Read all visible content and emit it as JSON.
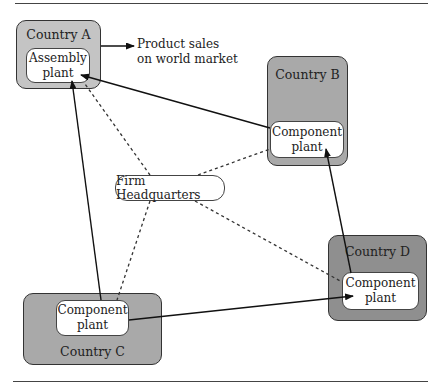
{
  "diagram": {
    "type": "flow-network",
    "countries": [
      {
        "id": "A",
        "label": "Country A",
        "fill": "#c4c4c4",
        "plant": {
          "line1": "Assembly",
          "line2": "plant"
        }
      },
      {
        "id": "B",
        "label": "Country B",
        "fill": "#a9a9a9",
        "plant": {
          "line1": "Component",
          "line2": "plant"
        }
      },
      {
        "id": "C",
        "label": "Country C",
        "fill": "#a9a9a9",
        "plant": {
          "line1": "Component",
          "line2": "plant"
        }
      },
      {
        "id": "D",
        "label": "Country D",
        "fill": "#8f8f8f",
        "plant": {
          "line1": "Component",
          "line2": "plant"
        }
      }
    ],
    "headquarters": {
      "label": "Firm Headquarters"
    },
    "output_note": {
      "line1": "Product sales",
      "line2": "on world market"
    },
    "edges": [
      {
        "from": "Country A",
        "to": "Product sales on world market",
        "style": "solid-arrow"
      },
      {
        "from": "Component plant (B)",
        "to": "Assembly plant (A)",
        "style": "solid-arrow"
      },
      {
        "from": "Component plant (C)",
        "to": "Assembly plant (A)",
        "style": "solid-arrow"
      },
      {
        "from": "Component plant (C)",
        "to": "Component plant (D)",
        "style": "solid-arrow"
      },
      {
        "from": "Component plant (D)",
        "to": "Component plant (B)",
        "style": "solid-arrow"
      },
      {
        "from": "Firm Headquarters",
        "to": "Assembly plant (A)",
        "style": "dashed"
      },
      {
        "from": "Firm Headquarters",
        "to": "Component plant (B)",
        "style": "dashed"
      },
      {
        "from": "Firm Headquarters",
        "to": "Component plant (C)",
        "style": "dashed"
      },
      {
        "from": "Firm Headquarters",
        "to": "Component plant (D)",
        "style": "dashed"
      }
    ]
  }
}
